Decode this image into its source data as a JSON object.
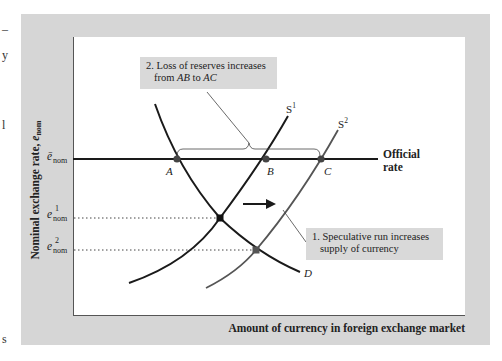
{
  "diagram": {
    "type": "supply-demand",
    "y_axis_label": {
      "prefix": "Nominal exchange rate, ",
      "var": "e",
      "sub": "nom"
    },
    "x_axis_label": "Amount of currency in foreign exchange market",
    "y_ticks": [
      {
        "id": "official",
        "var": "ē",
        "sub": "nom",
        "sup": ""
      },
      {
        "id": "e1",
        "var": "e",
        "sub": "nom",
        "sup": "1"
      },
      {
        "id": "e2",
        "var": "e",
        "sub": "nom",
        "sup": "2"
      }
    ],
    "official_rate_label_line1": "Official",
    "official_rate_label_line2": "rate",
    "points": [
      "A",
      "B",
      "C"
    ],
    "curves": {
      "S1": {
        "base": "S",
        "sup": "1"
      },
      "S2": {
        "base": "S",
        "sup": "2"
      },
      "D": {
        "base": "D"
      }
    },
    "callouts": {
      "reserves": {
        "line1": "2. Loss of reserves increases",
        "line2_pre": "from ",
        "line2_ab": "AB",
        "line2_mid": " to ",
        "line2_ac": "AC"
      },
      "speculative": {
        "line1": "1. Speculative run increases",
        "line2": "supply of currency"
      }
    },
    "colors": {
      "frame": "#d6d6d6",
      "callout_bg": "#d9d9d9",
      "curve_dark": "#1a1a1a",
      "curve_gray": "#555555"
    }
  },
  "edge_marks": [
    "–",
    "y",
    "l",
    "s"
  ]
}
